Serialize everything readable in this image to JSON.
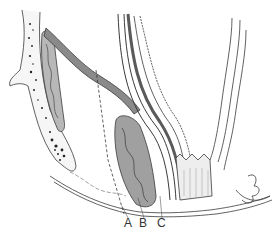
{
  "figure": {
    "type": "anatomical-line-illustration",
    "labels": [
      {
        "id": "A",
        "text": "A",
        "x": 127,
        "y": 220
      },
      {
        "id": "B",
        "text": "B",
        "x": 141,
        "y": 220
      },
      {
        "id": "C",
        "text": "C",
        "x": 160,
        "y": 220
      }
    ],
    "colors": {
      "line": "#3a3a3a",
      "shade_dark": "#6a6a6a",
      "shade_mid": "#a8a8a8",
      "shade_light": "#d4d4d4",
      "background": "#ffffff"
    }
  }
}
